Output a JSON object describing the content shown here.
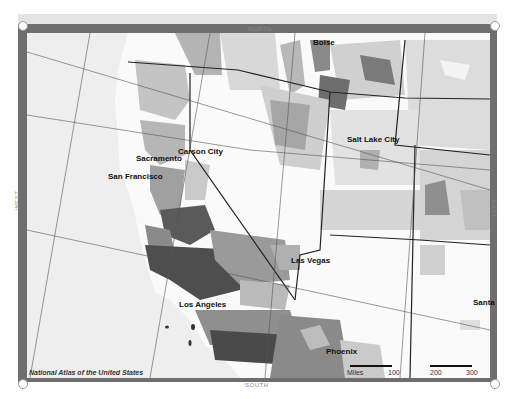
{
  "map": {
    "credit": "National Atlas of the United States",
    "compass": {
      "north": "NORTH",
      "south": "SOUTH",
      "west": "WEST",
      "east": "EAST"
    },
    "cities": [
      {
        "name": "Boise",
        "x": 313,
        "y": 44
      },
      {
        "name": "Salt Lake City",
        "x": 347,
        "y": 140
      },
      {
        "name": "Carson City",
        "x": 178,
        "y": 151
      },
      {
        "name": "Sacramento",
        "x": 136,
        "y": 158
      },
      {
        "name": "San Francisco",
        "x": 108,
        "y": 177
      },
      {
        "name": "Las Vegas",
        "x": 291,
        "y": 260
      },
      {
        "name": "Los Angeles",
        "x": 179,
        "y": 305
      },
      {
        "name": "Phoenix",
        "x": 326,
        "y": 351
      },
      {
        "name": "Santa",
        "x": 473,
        "y": 302
      }
    ],
    "scale_bar": {
      "unit": "Miles",
      "ticks": [
        "100",
        "200",
        "300"
      ]
    },
    "colors": {
      "frame": "#6e6e6e",
      "ocean": "#eeeeee",
      "land_light": "#fafafa",
      "shade_1": "#d8d8d8",
      "shade_2": "#b4b4b4",
      "shade_3": "#8a8a8a",
      "shade_4": "#5a5a5a"
    }
  }
}
